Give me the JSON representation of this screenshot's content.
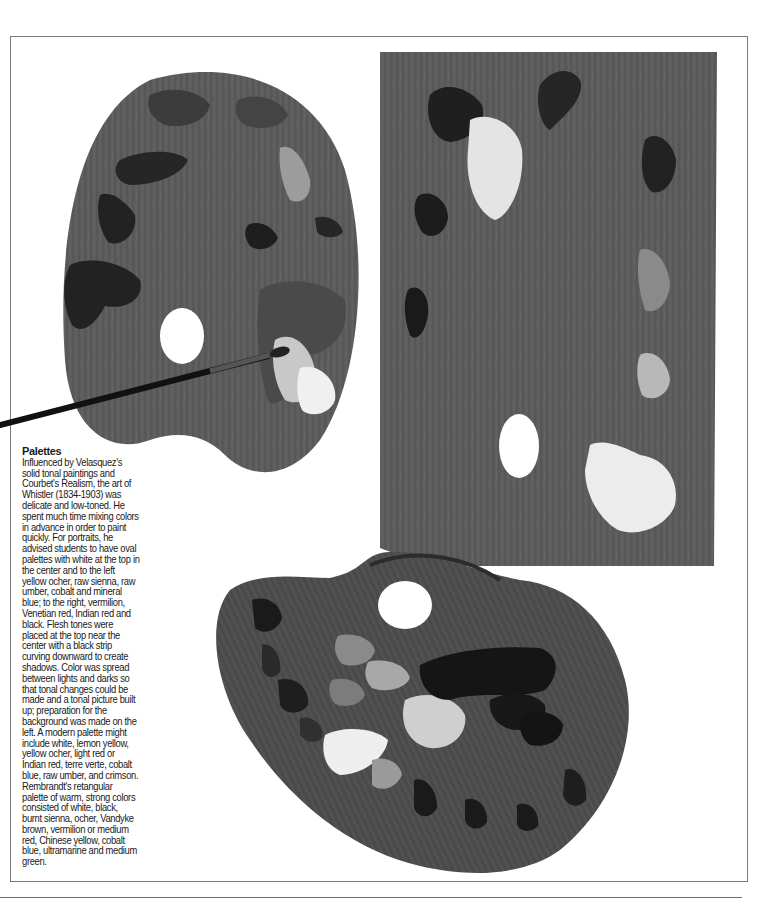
{
  "caption": {
    "title": "Palettes",
    "body": "Influenced by Velasquez's solid tonal paintings and Courbet's Realism, the art of Whistler (1834-1903) was delicate and low-toned. He spent much time mixing colors in advance in order to paint quickly. For portraits, he advised students to have oval palettes with white at the top in the center and to the left yellow ocher, raw sienna, raw umber, cobalt and mineral blue; to the right, vermilion, Venetian red, Indian red and black. Flesh tones were placed at the top near the center with a black strip curving downward to create shadows. Color was spread between lights and darks so that tonal changes could be made and a tonal picture built up; preparation for the background was made on the left. A modern palette might include white, lemon yellow, yellow ocher, light red or Indian red, terre verte, cobalt blue, raw umber, and crimson. Rembrandt's retangular palette of warm, strong colors consisted of white, black, burnt sienna, ocher, Vandyke brown, vermilion or medium red, Chinese yellow, cobalt blue, ultramarine and medium green."
  },
  "figures": {
    "oval_palette_top": {
      "label": "Oval palette with brush"
    },
    "rectangular_palette": {
      "label": "Rectangular palette"
    },
    "oval_palette_bottom": {
      "label": "Modern oval palette"
    }
  },
  "colors": {
    "wood": "#5a5a5a",
    "wood_dark": "#4a4a4a",
    "paint_dark": "#222222",
    "paint_light": "#e8e8e8",
    "frame": "#7a7a7a"
  }
}
